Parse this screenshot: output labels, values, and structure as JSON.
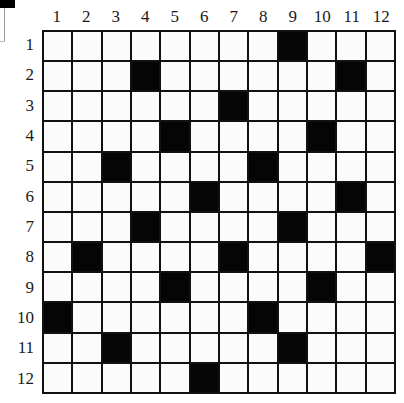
{
  "puzzle": {
    "rows": 12,
    "cols": 12,
    "column_labels": [
      "1",
      "2",
      "3",
      "4",
      "5",
      "6",
      "7",
      "8",
      "9",
      "10",
      "11",
      "12"
    ],
    "row_labels": [
      "1",
      "2",
      "3",
      "4",
      "5",
      "6",
      "7",
      "8",
      "9",
      "10",
      "11",
      "12"
    ],
    "black_cells": [
      [
        1,
        9
      ],
      [
        2,
        4
      ],
      [
        2,
        11
      ],
      [
        3,
        7
      ],
      [
        4,
        5
      ],
      [
        4,
        10
      ],
      [
        5,
        3
      ],
      [
        5,
        8
      ],
      [
        6,
        6
      ],
      [
        6,
        11
      ],
      [
        7,
        4
      ],
      [
        7,
        9
      ],
      [
        8,
        2
      ],
      [
        8,
        7
      ],
      [
        8,
        12
      ],
      [
        9,
        5
      ],
      [
        9,
        10
      ],
      [
        10,
        1
      ],
      [
        10,
        8
      ],
      [
        11,
        3
      ],
      [
        11,
        9
      ],
      [
        12,
        6
      ]
    ],
    "colors": {
      "grid_line": "#111111",
      "black_cell": "#050505",
      "white_cell": "#fbfbfb"
    }
  }
}
